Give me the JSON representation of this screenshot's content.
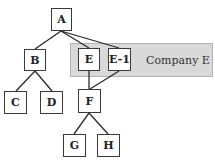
{
  "diagram": {
    "type": "org-tree",
    "nodes": [
      {
        "id": "A",
        "label": "A"
      },
      {
        "id": "B",
        "label": "B"
      },
      {
        "id": "C",
        "label": "C"
      },
      {
        "id": "D",
        "label": "D"
      },
      {
        "id": "E",
        "label": "E"
      },
      {
        "id": "E1",
        "label": "E-1"
      },
      {
        "id": "F",
        "label": "F"
      },
      {
        "id": "G",
        "label": "G"
      },
      {
        "id": "H",
        "label": "H"
      }
    ],
    "edges": [
      {
        "from": "A",
        "to": "B"
      },
      {
        "from": "A",
        "to": "E"
      },
      {
        "from": "A",
        "to": "E-1"
      },
      {
        "from": "B",
        "to": "C"
      },
      {
        "from": "B",
        "to": "D"
      },
      {
        "from": "E",
        "to": "F"
      },
      {
        "from": "E-1",
        "to": "F"
      },
      {
        "from": "F",
        "to": "G"
      },
      {
        "from": "F",
        "to": "H"
      }
    ],
    "group": {
      "label": "Company E",
      "members": [
        "E",
        "E-1"
      ],
      "fill_color": "#d9d9d9",
      "border_color": "#b3b3b3"
    },
    "colors": {
      "node_border": "#3a3a3a",
      "line": "#2a2a2a",
      "background": "#ffffff"
    }
  }
}
